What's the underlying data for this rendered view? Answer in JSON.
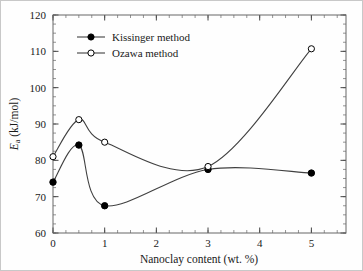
{
  "chart_data": {
    "type": "line",
    "title": "",
    "xlabel": "Nanoclay content (wt. %)",
    "ylabel": "E_a (kJ/mol)",
    "ylabel_main": "E",
    "ylabel_sub": "a",
    "ylabel_rest": " (kJ/mol)",
    "xlim": [
      0,
      5.67
    ],
    "ylim": [
      60,
      120
    ],
    "xticks": [
      0,
      1,
      2,
      3,
      4,
      5
    ],
    "xticklabels": [
      "0",
      "1",
      "2",
      "3",
      "4",
      "5"
    ],
    "yticks": [
      60,
      70,
      80,
      90,
      100,
      110,
      120
    ],
    "yticklabels": [
      "60",
      "70",
      "80",
      "90",
      "100",
      "110",
      "120"
    ],
    "x_minor_step": 0.25,
    "y_minor_step": 2.5,
    "grid": false,
    "legend_position": "upper-left-inside",
    "line_color": "#404040",
    "marker_color": "#000000",
    "axis_color": "#555555",
    "background": "#fefefe",
    "x": [
      0,
      0.5,
      1,
      3,
      5
    ],
    "series": [
      {
        "name": "Kissinger method",
        "marker": "filled-circle",
        "values": [
          74.0,
          84.2,
          67.5,
          77.5,
          76.5
        ]
      },
      {
        "name": "Ozawa method",
        "marker": "open-circle",
        "values": [
          81.0,
          91.2,
          85.0,
          78.3,
          110.7
        ]
      }
    ]
  },
  "legend": {
    "items": [
      {
        "label": "Kissinger method",
        "marker": "filled-circle"
      },
      {
        "label": "Ozawa method",
        "marker": "open-circle"
      }
    ]
  }
}
